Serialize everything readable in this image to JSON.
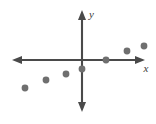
{
  "chart_data": {
    "type": "scatter",
    "title": "",
    "xlabel": "x",
    "ylabel": "y",
    "grid": false,
    "legend": null,
    "axes": {
      "style": "double-arrow-cartesian",
      "origin_px": [
        82,
        60
      ],
      "x_axis_px": {
        "from": [
          12,
          60
        ],
        "to": [
          145,
          60
        ]
      },
      "y_axis_px": {
        "from": [
          82,
          10
        ],
        "to": [
          82,
          112
        ]
      },
      "xlim": [
        -7,
        6.3
      ],
      "ylim": [
        -5.2,
        2.5
      ],
      "ticks_shown": false,
      "axis_color": "#4a4a4a"
    },
    "point_style": {
      "marker": "circle",
      "color": "#6f6f6f",
      "radius_px": 3.4,
      "count": 7
    },
    "points": [
      {
        "label": "p1",
        "x": -2.85,
        "y": -1.4,
        "px": [
          25,
          88
        ]
      },
      {
        "label": "p2",
        "x": -1.8,
        "y": -1.0,
        "px": [
          46,
          80
        ]
      },
      {
        "label": "p3",
        "x": -0.8,
        "y": -0.7,
        "px": [
          66,
          74
        ]
      },
      {
        "label": "p4",
        "x": 0.0,
        "y": -0.45,
        "px": [
          82,
          69
        ]
      },
      {
        "label": "p5",
        "x": 1.2,
        "y": 0.0,
        "px": [
          106,
          60
        ]
      },
      {
        "label": "p6",
        "x": 2.25,
        "y": 0.45,
        "px": [
          127,
          51
        ]
      },
      {
        "label": "p7",
        "x": 3.1,
        "y": 0.7,
        "px": [
          144,
          46
        ]
      }
    ],
    "x": [
      -2.85,
      -1.8,
      -0.8,
      0.0,
      1.2,
      2.25,
      3.1
    ],
    "y": [
      -1.4,
      -1.0,
      -0.7,
      -0.45,
      0.0,
      0.45,
      0.7
    ],
    "annotations": []
  },
  "labels": {
    "x_axis": "x",
    "y_axis": "y"
  },
  "colors": {
    "axis": "#4a4a4a",
    "point": "#6f6f6f",
    "background": "#ffffff",
    "label": "#3a3a3a"
  }
}
